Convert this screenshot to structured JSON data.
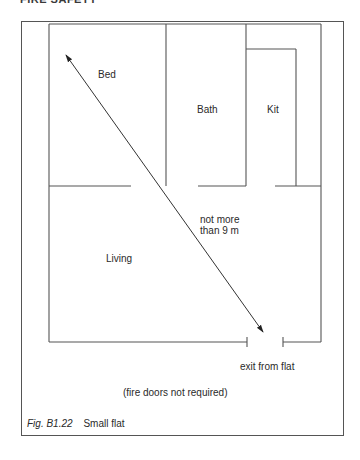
{
  "page": {
    "running_header": "FIRE SAFETY"
  },
  "figure": {
    "number": "Fig. B1.22",
    "title": "Small flat"
  },
  "rooms": {
    "bed": "Bed",
    "bath": "Bath",
    "kit": "Kit",
    "living": "Living"
  },
  "annotations": {
    "travel_distance_line1": "not more",
    "travel_distance_line2": "than 9 m",
    "exit": "exit from flat",
    "fire_doors": "(fire doors not required)"
  },
  "colors": {
    "line": "#555555",
    "text": "#2a2a2a",
    "background": "#ffffff"
  }
}
